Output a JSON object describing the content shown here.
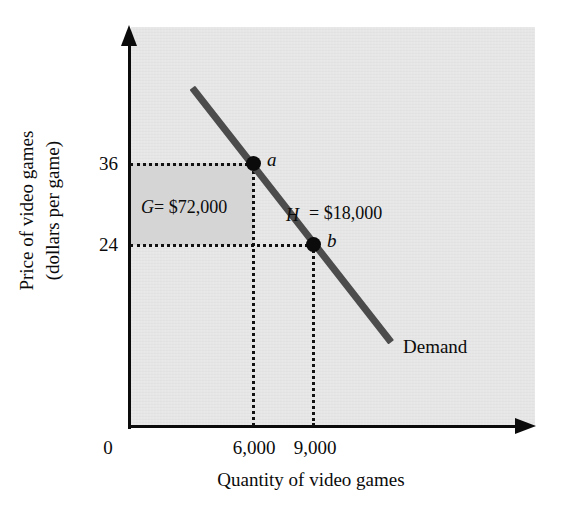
{
  "chart_data": {
    "type": "line",
    "title": "",
    "subtitle": "",
    "xlabel": "Quantity of video games",
    "ylabel_line1": "Price of video games",
    "ylabel_line2": "(dollars per game)",
    "grid": false,
    "legend_position": "inline-curve-label",
    "xlim": [
      0,
      13500
    ],
    "ylim": [
      0,
      60
    ],
    "x_tick_labels": [
      "0",
      "6,000",
      "9,000"
    ],
    "y_tick_labels": [
      "36",
      "24"
    ],
    "x_ticks": [
      0,
      6000,
      9000
    ],
    "y_ticks": [
      36,
      24
    ],
    "series": [
      {
        "name": "Demand",
        "type": "line",
        "x": [
          2000,
          8650
        ],
        "y": [
          51.4,
          14.2
        ],
        "label": "Demand",
        "color": "#4c4c4c"
      }
    ],
    "points": [
      {
        "id": "a",
        "label": "a",
        "x": 6000,
        "y": 36
      },
      {
        "id": "b",
        "label": "b",
        "x": 9000,
        "y": 24
      }
    ],
    "annotations": [
      {
        "id": "G",
        "symbol": "G",
        "separator": "=",
        "value": "$72,000",
        "text": "G = $72,000",
        "kind": "shaded-rectangle-area",
        "x_range": [
          0,
          6000
        ],
        "y_range": [
          24,
          36
        ]
      },
      {
        "id": "H",
        "symbol": "H",
        "separator": "=",
        "value": "$18,000",
        "text": "H = $18,000",
        "kind": "area-label",
        "x_range": [
          6000,
          9000
        ],
        "y_range": [
          0,
          24
        ]
      }
    ]
  },
  "axes": {
    "y": {
      "title_line1": "Price of video games",
      "title_line2": "(dollars per game)",
      "ticks": [
        {
          "label": "36"
        },
        {
          "label": "24"
        }
      ],
      "arrow": "up-arrow-icon"
    },
    "x": {
      "title": "Quantity of video games",
      "ticks": [
        {
          "label": "0"
        },
        {
          "label": "6,000"
        },
        {
          "label": "9,000"
        }
      ],
      "arrow": "right-arrow-icon"
    }
  },
  "marks": {
    "point_a_label": "a",
    "point_b_label": "b",
    "curve_label": "Demand",
    "area_g_symbol": "G",
    "area_g_equals_value": "= $72,000",
    "area_h_symbol": "H",
    "area_h_equals_value": "= $18,000"
  },
  "colors": {
    "plot_background": "#e4e4e4",
    "shaded_area_g": "#d5d5d5",
    "demand_curve": "#4c4c4c",
    "axis": "#0b0b0b",
    "text": "#0b0b0b",
    "page_background": "#ffffff"
  }
}
